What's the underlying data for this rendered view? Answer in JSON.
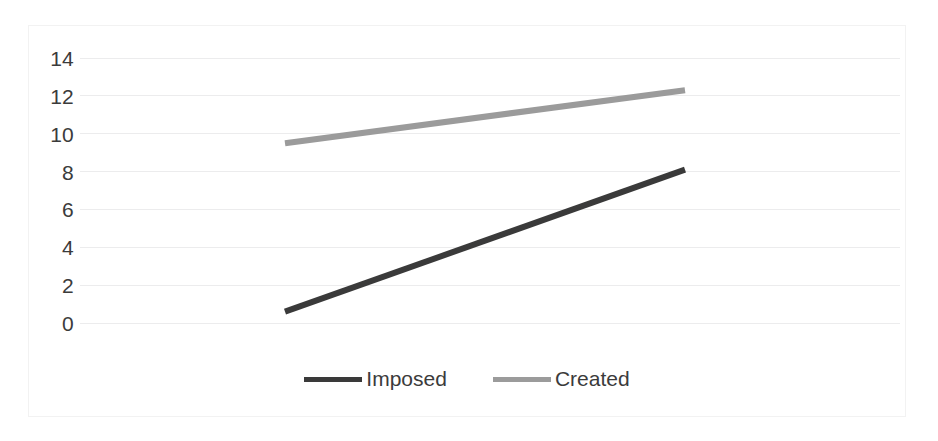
{
  "chart_data": {
    "type": "line",
    "title": "",
    "xlabel": "",
    "ylabel": "",
    "ylim": [
      0,
      14
    ],
    "xlim": [
      0,
      1
    ],
    "grid": true,
    "grid_axis": "y",
    "legend_position": "bottom",
    "y_ticks": [
      14,
      12,
      10,
      8,
      6,
      4,
      2,
      0
    ],
    "x_ticks": [],
    "x": [
      0,
      1
    ],
    "series": [
      {
        "name": "Imposed",
        "values": [
          0.6,
          8.1
        ],
        "color": "#3a3a3a",
        "width": 6
      },
      {
        "name": "Created",
        "values": [
          9.5,
          12.3
        ],
        "color": "#9b9b9b",
        "width": 6
      }
    ]
  },
  "axis": {
    "y_tick_labels": [
      "14",
      "12",
      "10",
      "8",
      "6",
      "4",
      "2",
      "0"
    ]
  },
  "legend": {
    "entries": [
      {
        "label": "Imposed",
        "color": "#3a3a3a"
      },
      {
        "label": "Created",
        "color": "#9b9b9b"
      }
    ]
  },
  "colors": {
    "background": "#ffffff",
    "frame": "#f2f2f2",
    "gridline": "#ececed",
    "text": "#3b3b3b",
    "imposed": "#3a3a3a",
    "created": "#9b9b9b"
  }
}
